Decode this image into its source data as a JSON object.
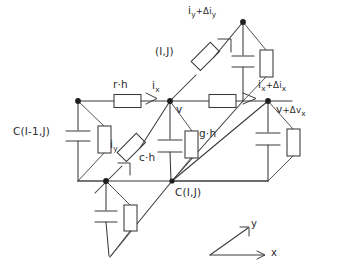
{
  "figure": {
    "kind": "circuit-schematic",
    "background_color": "#ffffff",
    "ink_color": "#3a3a3a"
  },
  "labels": {
    "top_current": {
      "base": "i",
      "sub1": "y",
      "op": "+Δi",
      "sub2": "y",
      "text": "iy+Δiy"
    },
    "cell_index": {
      "text": "(I,J)"
    },
    "series_resistor_x": {
      "text": "r·h"
    },
    "current_x": {
      "base": "i",
      "sub": "x",
      "text": "ix"
    },
    "current_x_out": {
      "base": "i",
      "sub1": "x",
      "op": "+Δi",
      "sub2": "x",
      "text": "ix+Δix"
    },
    "voltage_out": {
      "base": "v",
      "op": "+Δv",
      "sub": "x",
      "text": "v+Δvx"
    },
    "node_voltage": {
      "text": "v"
    },
    "shunt_conductance": {
      "text": "g·h"
    },
    "shunt_capacitance": {
      "text": "c·h"
    },
    "current_y": {
      "base": "i",
      "sub": "y",
      "text": "iy"
    },
    "cap_left": {
      "text": "C(I-1,J)"
    },
    "cap_center": {
      "text": "C(I,J)"
    }
  },
  "axes": {
    "x_label": "x",
    "y_label": "y"
  },
  "nodes": [
    {
      "name": "left-node",
      "x": 78,
      "y": 101
    },
    {
      "name": "center-node",
      "x": 170,
      "y": 101
    },
    {
      "name": "right-node",
      "x": 268,
      "y": 101
    },
    {
      "name": "top-node",
      "x": 243,
      "y": 22
    },
    {
      "name": "bottom-left-node",
      "x": 106,
      "y": 181
    },
    {
      "name": "bottom-mid-node",
      "x": 172,
      "y": 181
    }
  ],
  "components": [
    {
      "name": "resistor-r-h",
      "type": "resistor",
      "orientation": "horizontal"
    },
    {
      "name": "resistor-series-right",
      "type": "resistor",
      "orientation": "horizontal"
    },
    {
      "name": "resistor-diagonal-ij",
      "type": "resistor",
      "orientation": "diagonal"
    },
    {
      "name": "resistor-diagonal-iy",
      "type": "resistor",
      "orientation": "diagonal"
    },
    {
      "name": "resistor-shunt-left",
      "type": "resistor",
      "orientation": "vertical"
    },
    {
      "name": "resistor-shunt-center",
      "type": "resistor",
      "orientation": "vertical"
    },
    {
      "name": "resistor-shunt-right",
      "type": "resistor",
      "orientation": "vertical"
    },
    {
      "name": "resistor-shunt-top",
      "type": "resistor",
      "orientation": "vertical"
    },
    {
      "name": "resistor-shunt-bottom",
      "type": "resistor",
      "orientation": "vertical"
    },
    {
      "name": "capacitor-left",
      "type": "capacitor",
      "orientation": "vertical"
    },
    {
      "name": "capacitor-center",
      "type": "capacitor",
      "orientation": "vertical"
    },
    {
      "name": "capacitor-right",
      "type": "capacitor",
      "orientation": "vertical"
    },
    {
      "name": "capacitor-top",
      "type": "capacitor",
      "orientation": "vertical"
    },
    {
      "name": "capacitor-bottom",
      "type": "capacitor",
      "orientation": "vertical"
    }
  ]
}
